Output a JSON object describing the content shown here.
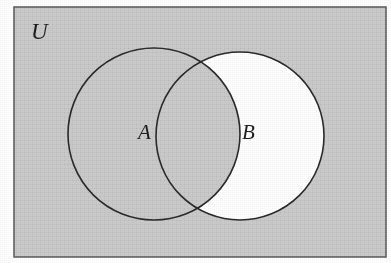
{
  "figure": {
    "kind": "venn-diagram",
    "caption_labels": {
      "universe": "U",
      "set_a": "A",
      "set_b": "B"
    },
    "colors": {
      "page": "#ffffff",
      "universe_fill": "#c9c9c9",
      "shaded_fill": "#c9c9c9",
      "unshaded_fill": "#ffffff",
      "stroke": "#2a2a2a",
      "frame_stroke": "#555555"
    },
    "frame": {
      "x": 14,
      "y": 7,
      "width": 372,
      "height": 250,
      "stroke_width": 1.5
    },
    "regions": [
      {
        "name": "outside-A-and-B",
        "expression": "(A ∪ B)'",
        "shaded": true
      },
      {
        "name": "A-only",
        "expression": "A − B",
        "shaded": true
      },
      {
        "name": "A-intersect-B",
        "expression": "A ∩ B",
        "shaded": true
      },
      {
        "name": "B-only",
        "expression": "B − A",
        "shaded": false
      }
    ],
    "shaded_set": "B'",
    "circles": [
      {
        "id": "A",
        "cx": 154,
        "cy": 134,
        "r": 86,
        "fill": "shaded",
        "label": "A",
        "label_x": 144,
        "label_y": 140
      },
      {
        "id": "B",
        "cx": 240,
        "cy": 136,
        "r": 84,
        "fill": "unshaded",
        "label": "B",
        "label_x": 248,
        "label_y": 140
      }
    ]
  }
}
